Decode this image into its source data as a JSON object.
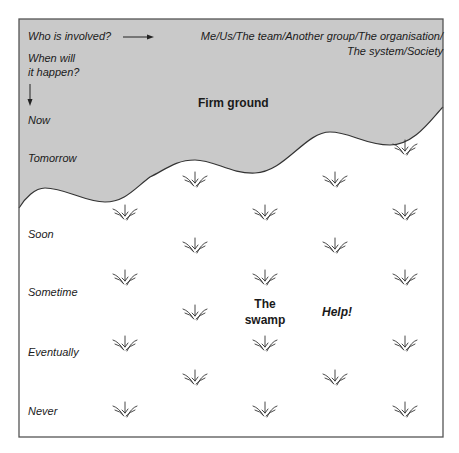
{
  "diagram": {
    "title_region": "Firm ground",
    "swamp_label": [
      "The",
      "swamp"
    ],
    "help_label": "Help!",
    "who_label": "Who is involved?",
    "who_values_line1": "Me/Us/The team/Another group/The organisation/",
    "who_values_line2": "The system/Society",
    "when_label_line1": "When will",
    "when_label_line2": "it happen?",
    "time_labels": [
      "Now",
      "Tomorrow",
      "Soon",
      "Sometime",
      "Eventually",
      "Never"
    ],
    "colors": {
      "firm_ground": "#c9c9c9",
      "swamp": "#ffffff",
      "border": "#555555",
      "text": "#1a1a1a"
    },
    "tufts": [
      [
        405,
        148
      ],
      [
        195,
        180
      ],
      [
        335,
        180
      ],
      [
        125,
        213
      ],
      [
        265,
        213
      ],
      [
        405,
        213
      ],
      [
        195,
        246
      ],
      [
        335,
        246
      ],
      [
        125,
        278
      ],
      [
        265,
        278
      ],
      [
        405,
        278
      ],
      [
        195,
        313
      ],
      [
        125,
        344
      ],
      [
        265,
        344
      ],
      [
        405,
        344
      ],
      [
        195,
        378
      ],
      [
        335,
        378
      ],
      [
        125,
        410
      ],
      [
        265,
        410
      ],
      [
        405,
        410
      ]
    ]
  }
}
